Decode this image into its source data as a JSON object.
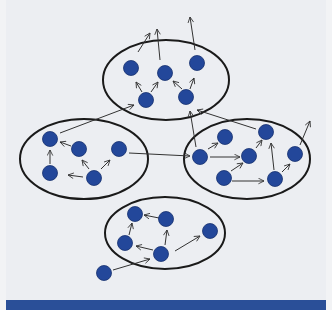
{
  "figure": {
    "caption": "",
    "colors": {
      "background": "#eceef2",
      "node": "#23479a",
      "outline": "#1a1a1a",
      "arrow": "#333333",
      "caption_bar": "#2a4f98"
    }
  },
  "diagram": {
    "groups": [
      {
        "id": "top",
        "cx": 166,
        "cy": 80,
        "rx": 63,
        "ry": 40
      },
      {
        "id": "left",
        "cx": 84,
        "cy": 159,
        "rx": 64,
        "ry": 40
      },
      {
        "id": "right",
        "cx": 247,
        "cy": 159,
        "rx": 63,
        "ry": 40
      },
      {
        "id": "bottom",
        "cx": 165,
        "cy": 233,
        "rx": 60,
        "ry": 36
      }
    ],
    "nodes": [
      {
        "id": "t1",
        "x": 131,
        "y": 68
      },
      {
        "id": "t2",
        "x": 165,
        "y": 73
      },
      {
        "id": "t3",
        "x": 197,
        "y": 63
      },
      {
        "id": "t4",
        "x": 146,
        "y": 100
      },
      {
        "id": "t5",
        "x": 186,
        "y": 97
      },
      {
        "id": "l1",
        "x": 50,
        "y": 139
      },
      {
        "id": "l2",
        "x": 79,
        "y": 149
      },
      {
        "id": "l3",
        "x": 119,
        "y": 149
      },
      {
        "id": "l4",
        "x": 50,
        "y": 173
      },
      {
        "id": "l5",
        "x": 94,
        "y": 178
      },
      {
        "id": "r1",
        "x": 225,
        "y": 137
      },
      {
        "id": "r2",
        "x": 266,
        "y": 132
      },
      {
        "id": "r3",
        "x": 200,
        "y": 157
      },
      {
        "id": "r4",
        "x": 249,
        "y": 156
      },
      {
        "id": "r5",
        "x": 295,
        "y": 154
      },
      {
        "id": "r6",
        "x": 224,
        "y": 178
      },
      {
        "id": "r7",
        "x": 275,
        "y": 179
      },
      {
        "id": "b1",
        "x": 135,
        "y": 214
      },
      {
        "id": "b2",
        "x": 166,
        "y": 219
      },
      {
        "id": "b3",
        "x": 210,
        "y": 231
      },
      {
        "id": "b4",
        "x": 125,
        "y": 243
      },
      {
        "id": "b5",
        "x": 161,
        "y": 254
      },
      {
        "id": "b6",
        "x": 104,
        "y": 273
      }
    ],
    "arrows": [
      {
        "x1": 138,
        "y1": 52,
        "x2": 150,
        "y2": 33
      },
      {
        "x1": 160,
        "y1": 60,
        "x2": 157,
        "y2": 29
      },
      {
        "x1": 195,
        "y1": 50,
        "x2": 190,
        "y2": 17
      },
      {
        "x1": 142,
        "y1": 92,
        "x2": 136,
        "y2": 82
      },
      {
        "x1": 151,
        "y1": 92,
        "x2": 158,
        "y2": 82
      },
      {
        "x1": 182,
        "y1": 89,
        "x2": 173,
        "y2": 81
      },
      {
        "x1": 190,
        "y1": 89,
        "x2": 194,
        "y2": 78
      },
      {
        "x1": 60,
        "y1": 133,
        "x2": 134,
        "y2": 105
      },
      {
        "x1": 71,
        "y1": 146,
        "x2": 60,
        "y2": 142
      },
      {
        "x1": 50,
        "y1": 164,
        "x2": 50,
        "y2": 150
      },
      {
        "x1": 89,
        "y1": 169,
        "x2": 82,
        "y2": 160
      },
      {
        "x1": 83,
        "y1": 177,
        "x2": 68,
        "y2": 175
      },
      {
        "x1": 101,
        "y1": 169,
        "x2": 110,
        "y2": 160
      },
      {
        "x1": 129,
        "y1": 153,
        "x2": 190,
        "y2": 156
      },
      {
        "x1": 196,
        "y1": 147,
        "x2": 190,
        "y2": 111
      },
      {
        "x1": 256,
        "y1": 129,
        "x2": 197,
        "y2": 110
      },
      {
        "x1": 210,
        "y1": 157,
        "x2": 240,
        "y2": 157
      },
      {
        "x1": 208,
        "y1": 149,
        "x2": 218,
        "y2": 143
      },
      {
        "x1": 231,
        "y1": 171,
        "x2": 243,
        "y2": 163
      },
      {
        "x1": 256,
        "y1": 148,
        "x2": 262,
        "y2": 140
      },
      {
        "x1": 232,
        "y1": 181,
        "x2": 264,
        "y2": 181
      },
      {
        "x1": 274,
        "y1": 170,
        "x2": 271,
        "y2": 143
      },
      {
        "x1": 282,
        "y1": 172,
        "x2": 290,
        "y2": 164
      },
      {
        "x1": 300,
        "y1": 145,
        "x2": 310,
        "y2": 121
      },
      {
        "x1": 159,
        "y1": 218,
        "x2": 144,
        "y2": 215
      },
      {
        "x1": 129,
        "y1": 235,
        "x2": 132,
        "y2": 223
      },
      {
        "x1": 165,
        "y1": 245,
        "x2": 167,
        "y2": 230
      },
      {
        "x1": 153,
        "y1": 250,
        "x2": 136,
        "y2": 246
      },
      {
        "x1": 175,
        "y1": 251,
        "x2": 200,
        "y2": 236
      },
      {
        "x1": 113,
        "y1": 270,
        "x2": 150,
        "y2": 259
      }
    ]
  }
}
